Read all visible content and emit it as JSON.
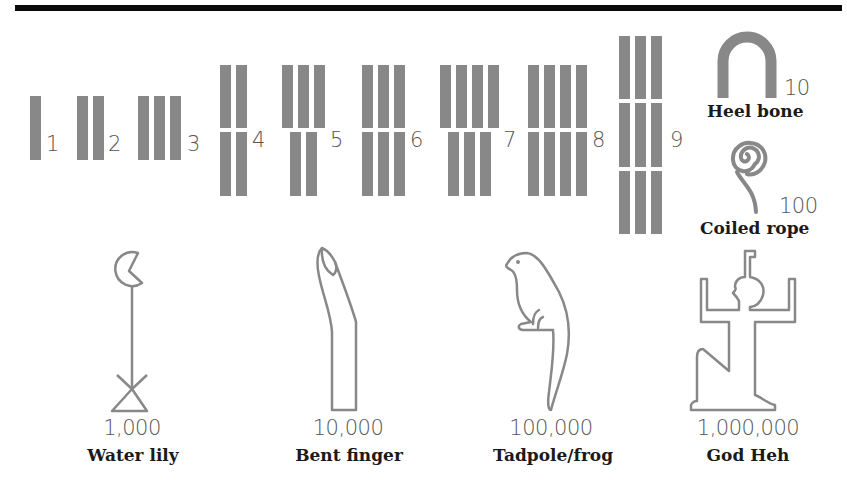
{
  "colors": {
    "glyph": "#888888",
    "rule": "#0a0a0a",
    "number_text": "#555555",
    "label_text": "#1a1a1a"
  },
  "units": [
    {
      "value": "1",
      "strokes": 1
    },
    {
      "value": "2",
      "strokes": 2
    },
    {
      "value": "3",
      "strokes": 3
    },
    {
      "value": "4",
      "strokes": 4
    },
    {
      "value": "5",
      "strokes": 5
    },
    {
      "value": "6",
      "strokes": 6
    },
    {
      "value": "7",
      "strokes": 7
    },
    {
      "value": "8",
      "strokes": 8
    },
    {
      "value": "9",
      "strokes": 9
    }
  ],
  "symbols": [
    {
      "value": "10",
      "name": "Heel bone",
      "icon": "heel-bone-icon"
    },
    {
      "value": "100",
      "name": "Coiled rope",
      "icon": "coiled-rope-icon"
    },
    {
      "value": "1,000",
      "name": "Water lily",
      "icon": "water-lily-icon"
    },
    {
      "value": "10,000",
      "name": "Bent finger",
      "icon": "bent-finger-icon"
    },
    {
      "value": "100,000",
      "name": "Tadpole/frog",
      "icon": "tadpole-frog-icon"
    },
    {
      "value": "1,000,000",
      "name": "God Heh",
      "icon": "god-heh-icon"
    }
  ]
}
